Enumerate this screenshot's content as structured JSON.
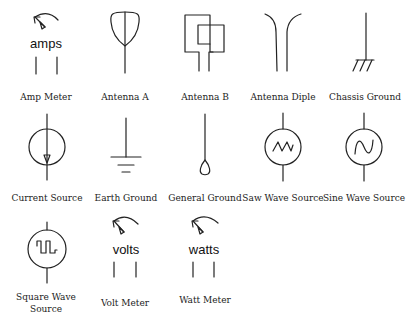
{
  "colors": {
    "stroke": "#222222",
    "text": "#222222",
    "background": "#ffffff"
  },
  "symbols": [
    {
      "id": "amp-meter",
      "label": "Amp Meter",
      "unit_text": "amps",
      "row": 1,
      "col": 1
    },
    {
      "id": "antenna-a",
      "label": "Antenna A",
      "row": 1,
      "col": 2
    },
    {
      "id": "antenna-b",
      "label": "Antenna B",
      "row": 1,
      "col": 3
    },
    {
      "id": "antenna-diple",
      "label": "Antenna Diple",
      "row": 1,
      "col": 4
    },
    {
      "id": "chassis-ground",
      "label": "Chassis Ground",
      "row": 1,
      "col": 5
    },
    {
      "id": "current-source",
      "label": "Current Source",
      "row": 2,
      "col": 1
    },
    {
      "id": "earth-ground",
      "label": "Earth Ground",
      "row": 2,
      "col": 2
    },
    {
      "id": "general-ground",
      "label": "General Ground",
      "row": 2,
      "col": 3
    },
    {
      "id": "saw-wave-source",
      "label": "Saw Wave Source",
      "row": 2,
      "col": 4
    },
    {
      "id": "sine-wave-source",
      "label": "Sine Wave Source",
      "row": 2,
      "col": 5
    },
    {
      "id": "square-wave-source",
      "label": "Square Wave Source",
      "row": 3,
      "col": 1
    },
    {
      "id": "volt-meter",
      "label": "Volt Meter",
      "unit_text": "volts",
      "row": 3,
      "col": 2
    },
    {
      "id": "watt-meter",
      "label": "Watt Meter",
      "unit_text": "watts",
      "row": 3,
      "col": 3
    }
  ]
}
